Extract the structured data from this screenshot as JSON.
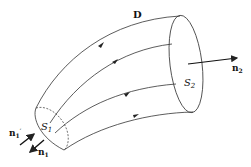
{
  "diagram": {
    "title_label": "D",
    "surface_left": "S",
    "surface_left_sub": "1",
    "surface_right": "S",
    "surface_right_sub": "2",
    "normal_out_right": "n",
    "normal_out_right_sub": "2",
    "normal_in_left": "n",
    "normal_in_left_sub": "1",
    "normal_in_left_prime": "′",
    "normal_out_left": "n",
    "normal_out_left_sub": "1",
    "stroke_color": "#333333"
  }
}
